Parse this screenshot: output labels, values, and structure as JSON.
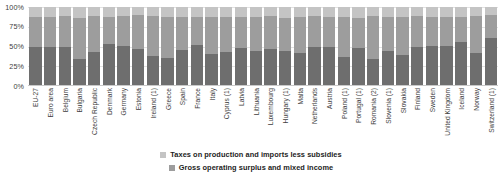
{
  "chart_data": {
    "type": "bar",
    "subtype": "100% stacked column",
    "title": "",
    "xlabel": "",
    "ylabel": "",
    "ylim": [
      0,
      100
    ],
    "ytick_labels": [
      "100%",
      "75%",
      "50%",
      "25%",
      "0%"
    ],
    "ytick_values": [
      100,
      75,
      50,
      25,
      0
    ],
    "grid": true,
    "legend_position": "bottom-center",
    "categories": [
      "EU-27",
      "Euro area",
      "Belgium",
      "Bulgaria",
      "Czech Republic",
      "Denmark",
      "Germany",
      "Estonia",
      "Ireland (1)",
      "Greece",
      "Spain",
      "France",
      "Italy",
      "Cyprus (1)",
      "Latvia",
      "Lithuania",
      "Luxembourg",
      "Hungary (1)",
      "Malta",
      "Netherlands",
      "Austria",
      "Poland (1)",
      "Portugal (1)",
      "Romania (2)",
      "Slovenia (1)",
      "Slovakia",
      "Finland",
      "Sweden",
      "United Kingdom",
      "Iceland",
      "Norway",
      "Switzerland (1)"
    ],
    "series": [
      {
        "name": "Compensation of employees",
        "color": "#6e6e6e",
        "values": [
          49,
          49,
          50,
          34,
          43,
          53,
          51,
          47,
          38,
          35,
          46,
          52,
          41,
          43,
          48,
          44,
          47,
          44,
          42,
          50,
          49,
          37,
          48,
          34,
          44,
          39,
          50,
          51,
          51,
          56,
          42,
          61
        ]
      },
      {
        "name": "Gross operating surplus and mixed income",
        "color": "#9d9d9d",
        "values": [
          39,
          39,
          38,
          52,
          45,
          34,
          38,
          43,
          51,
          52,
          42,
          35,
          47,
          44,
          40,
          44,
          42,
          42,
          45,
          38,
          39,
          50,
          38,
          55,
          44,
          49,
          38,
          36,
          36,
          32,
          47,
          29
        ]
      },
      {
        "name": "Taxes on production and imports less subsidies",
        "color": "#c4c4c4",
        "values": [
          12,
          12,
          12,
          14,
          12,
          13,
          11,
          10,
          11,
          13,
          12,
          13,
          12,
          13,
          12,
          12,
          11,
          14,
          13,
          12,
          12,
          13,
          14,
          11,
          12,
          12,
          12,
          13,
          13,
          12,
          11,
          10
        ]
      }
    ]
  },
  "legend": {
    "items": [
      {
        "label": "Taxes on production and imports less subsidies",
        "swatch": "sw-tax"
      },
      {
        "label": "Gross operating surplus and mixed income",
        "swatch": "sw-gos"
      }
    ]
  }
}
